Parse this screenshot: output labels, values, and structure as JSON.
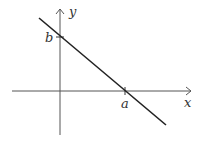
{
  "diagram": {
    "axes": {
      "x_label": "x",
      "y_label": "y"
    },
    "intercepts": {
      "x_intercept_label": "a",
      "y_intercept_label": "b"
    },
    "colors": {
      "axis": "#555555",
      "line": "#222222",
      "text": "#333333"
    }
  }
}
